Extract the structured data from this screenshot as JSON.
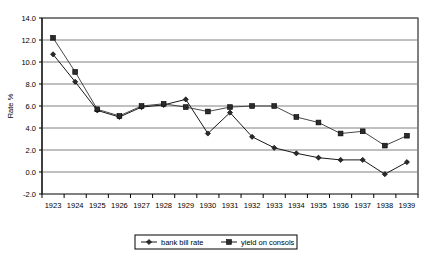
{
  "chart_data": {
    "type": "line",
    "title": "",
    "xlabel": "",
    "ylabel": "Rate %",
    "x": [
      1923,
      1924,
      1925,
      1926,
      1927,
      1928,
      1929,
      1930,
      1931,
      1932,
      1933,
      1934,
      1935,
      1936,
      1937,
      1938,
      1939
    ],
    "xtick_labels": [
      "1923",
      "1924",
      "1925",
      "1926",
      "1927",
      "1928",
      "1929",
      "1930",
      "1931",
      "1932",
      "1933",
      "1934",
      "1935",
      "1936",
      "1937",
      "1938",
      "1939"
    ],
    "ylim": [
      -2.0,
      14.0
    ],
    "ytick_labels": [
      "14.0",
      "12.0",
      "10.0",
      "8.0",
      "6.0",
      "4.0",
      "2.0",
      "0.0",
      "-2.0"
    ],
    "yticks": [
      14.0,
      12.0,
      10.0,
      8.0,
      6.0,
      4.0,
      2.0,
      0.0,
      -2.0
    ],
    "grid": "horizontal",
    "legend_position": "bottom-center",
    "series": [
      {
        "name": "bank bill rate",
        "marker": "diamond",
        "color": "#000000",
        "values": [
          10.7,
          8.2,
          5.6,
          5.0,
          5.9,
          6.1,
          6.6,
          3.5,
          5.4,
          3.2,
          2.2,
          1.7,
          1.3,
          1.1,
          1.1,
          -0.2,
          0.9
        ]
      },
      {
        "name": "yield on consols",
        "marker": "square",
        "color": "#333333",
        "values": [
          12.2,
          9.1,
          5.7,
          5.1,
          6.0,
          6.2,
          5.9,
          5.5,
          5.9,
          6.0,
          6.0,
          5.0,
          4.5,
          3.5,
          3.7,
          2.4,
          3.3
        ]
      }
    ]
  },
  "legend": {
    "items": [
      {
        "label": "bank bill rate"
      },
      {
        "label": "yield on consols"
      }
    ]
  },
  "axes": {
    "y_title": "Rate %"
  }
}
